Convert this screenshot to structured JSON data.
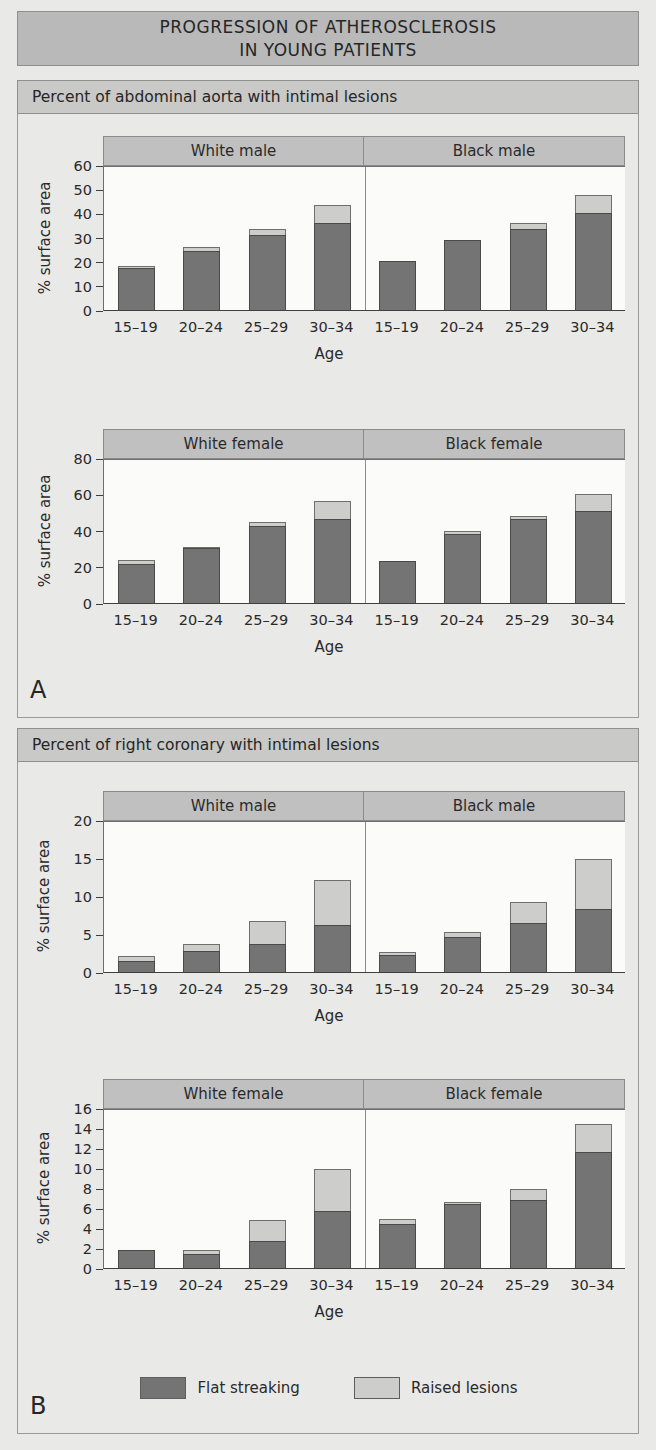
{
  "title": {
    "line1": "PROGRESSION OF ATHEROSCLEROSIS",
    "line2": "IN YOUNG PATIENTS"
  },
  "panels": [
    {
      "letter": "A",
      "caption": "Percent of abdominal aorta with intimal lesions"
    },
    {
      "letter": "B",
      "caption": "Percent of right coronary with intimal lesions"
    }
  ],
  "legend": {
    "flat_label": "Flat streaking",
    "raised_label": "Raised lesions",
    "flat_color": "#747474",
    "raised_color": "#cdcdcb"
  },
  "axis": {
    "ylabel": "% surface area",
    "xlabel": "Age"
  },
  "categories": [
    "15–19",
    "20–24",
    "25–29",
    "30–34"
  ],
  "groups_male": [
    "White male",
    "Black male"
  ],
  "groups_female": [
    "White female",
    "Black female"
  ],
  "chart_data": [
    {
      "id": "aorta-male",
      "type": "bar",
      "stacked": true,
      "title": "Percent of abdominal aorta with intimal lesions — male",
      "xlabel": "Age",
      "ylabel": "% surface area",
      "ylim": [
        0,
        60
      ],
      "yticks": [
        0,
        10,
        20,
        30,
        40,
        50,
        60
      ],
      "grid": false,
      "legend_position": "bottom",
      "groups": [
        {
          "name": "White male",
          "categories": [
            "15–19",
            "20–24",
            "25–29",
            "30–34"
          ],
          "series": [
            {
              "name": "Flat streaking",
              "values": [
                17.8,
                25.0,
                31.5,
                36.5
              ]
            },
            {
              "name": "Raised lesions",
              "values": [
                0.8,
                1.3,
                2.5,
                7.5
              ]
            }
          ],
          "totals": [
            18.6,
            26.3,
            34.0,
            44.0
          ]
        },
        {
          "name": "Black male",
          "categories": [
            "15–19",
            "20–24",
            "25–29",
            "30–34"
          ],
          "series": [
            {
              "name": "Flat streaking",
              "values": [
                20.8,
                29.3,
                33.8,
                40.5
              ]
            },
            {
              "name": "Raised lesions",
              "values": [
                0.0,
                0.0,
                2.7,
                7.5
              ]
            }
          ],
          "totals": [
            20.8,
            29.3,
            36.5,
            48.0
          ]
        }
      ]
    },
    {
      "id": "aorta-female",
      "type": "bar",
      "stacked": true,
      "title": "Percent of abdominal aorta with intimal lesions — female",
      "xlabel": "Age",
      "ylabel": "% surface area",
      "ylim": [
        0,
        80
      ],
      "yticks": [
        0,
        20,
        40,
        60,
        80
      ],
      "grid": false,
      "legend_position": "bottom",
      "groups": [
        {
          "name": "White female",
          "categories": [
            "15–19",
            "20–24",
            "25–29",
            "30–34"
          ],
          "series": [
            {
              "name": "Flat streaking",
              "values": [
                22.0,
                31.0,
                42.8,
                47.0
              ]
            },
            {
              "name": "Raised lesions",
              "values": [
                2.5,
                0.5,
                2.7,
                10.0
              ]
            }
          ],
          "totals": [
            24.5,
            31.5,
            45.5,
            57.0
          ]
        },
        {
          "name": "Black female",
          "categories": [
            "15–19",
            "20–24",
            "25–29",
            "30–34"
          ],
          "series": [
            {
              "name": "Flat streaking",
              "values": [
                23.8,
                38.8,
                47.0,
                51.5
              ]
            },
            {
              "name": "Raised lesions",
              "values": [
                0.0,
                1.5,
                1.8,
                9.0
              ]
            }
          ],
          "totals": [
            23.8,
            40.3,
            48.8,
            60.5
          ]
        }
      ]
    },
    {
      "id": "coronary-male",
      "type": "bar",
      "stacked": true,
      "title": "Percent of right coronary with intimal lesions — male",
      "xlabel": "Age",
      "ylabel": "% surface area",
      "ylim": [
        0,
        20
      ],
      "yticks": [
        0,
        5,
        10,
        15,
        20
      ],
      "grid": false,
      "legend_position": "bottom",
      "groups": [
        {
          "name": "White male",
          "categories": [
            "15–19",
            "20–24",
            "25–29",
            "30–34"
          ],
          "series": [
            {
              "name": "Flat streaking",
              "values": [
                1.6,
                2.9,
                3.8,
                6.3
              ]
            },
            {
              "name": "Raised lesions",
              "values": [
                0.7,
                0.9,
                3.0,
                6.0
              ]
            }
          ],
          "totals": [
            2.3,
            3.8,
            6.8,
            12.3
          ]
        },
        {
          "name": "Black male",
          "categories": [
            "15–19",
            "20–24",
            "25–29",
            "30–34"
          ],
          "series": [
            {
              "name": "Flat streaking",
              "values": [
                2.4,
                4.7,
                6.6,
                8.4
              ]
            },
            {
              "name": "Raised lesions",
              "values": [
                0.4,
                0.7,
                2.7,
                6.6
              ]
            }
          ],
          "totals": [
            2.8,
            5.4,
            9.3,
            15.0
          ]
        }
      ]
    },
    {
      "id": "coronary-female",
      "type": "bar",
      "stacked": true,
      "title": "Percent of right coronary with intimal lesions — female",
      "xlabel": "Age",
      "ylabel": "% surface area",
      "ylim": [
        0,
        16
      ],
      "yticks": [
        0,
        2,
        4,
        6,
        8,
        10,
        12,
        14,
        16
      ],
      "grid": false,
      "legend_position": "bottom",
      "groups": [
        {
          "name": "White female",
          "categories": [
            "15–19",
            "20–24",
            "25–29",
            "30–34"
          ],
          "series": [
            {
              "name": "Flat streaking",
              "values": [
                1.9,
                1.5,
                2.8,
                5.8
              ]
            },
            {
              "name": "Raised lesions",
              "values": [
                0.0,
                0.4,
                2.1,
                4.2
              ]
            }
          ],
          "totals": [
            1.9,
            1.9,
            4.9,
            10.0
          ]
        },
        {
          "name": "Black female",
          "categories": [
            "15–19",
            "20–24",
            "25–29",
            "30–34"
          ],
          "series": [
            {
              "name": "Flat streaking",
              "values": [
                4.5,
                6.5,
                6.9,
                11.7
              ]
            },
            {
              "name": "Raised lesions",
              "values": [
                0.5,
                0.2,
                1.1,
                2.8
              ]
            }
          ],
          "totals": [
            5.0,
            6.7,
            8.0,
            14.5
          ]
        }
      ]
    }
  ]
}
